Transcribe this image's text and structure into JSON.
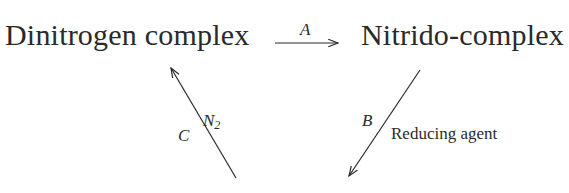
{
  "diagram": {
    "nodes": [
      {
        "id": "dinitrogen",
        "label": "Dinitrogen complex"
      },
      {
        "id": "nitrido",
        "label": "Nitrido-complex"
      }
    ],
    "edges": [
      {
        "from": "dinitrogen",
        "to": "nitrido",
        "label": "A",
        "reagent": ""
      },
      {
        "from": "nitrido",
        "to": "(cropped)",
        "label": "B",
        "reagent": "Reducing agent"
      },
      {
        "from": "(cropped)",
        "to": "dinitrogen",
        "label": "C",
        "reagent": "N",
        "reagent_subscript": "2"
      }
    ],
    "colors": {
      "ink": "#2a2a2a",
      "background": "#ffffff"
    }
  }
}
